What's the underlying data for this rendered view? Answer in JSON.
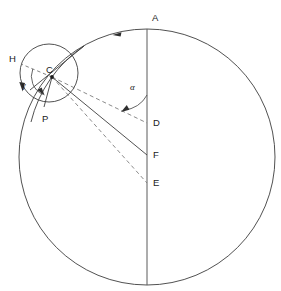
{
  "figure": {
    "kind": "geometric-diagram",
    "background_color": "#ffffff",
    "line_color": "#3d3d3d",
    "dashed_color": "#767676",
    "canvas": {
      "width": 281,
      "height": 291
    }
  },
  "labels": {
    "A": "A",
    "H": "H",
    "C": "C",
    "P": "P",
    "D": "D",
    "F": "F",
    "E": "E",
    "alpha": "α",
    "gamma": "γ"
  },
  "points": {
    "A": {
      "x": 152,
      "y": 18,
      "anchor_x": 147,
      "anchor_y": 29
    },
    "H": {
      "x": 12,
      "y": 59,
      "anchor_x": 21,
      "anchor_y": 64
    },
    "C": {
      "x": 49,
      "y": 70,
      "anchor_x": 52,
      "anchor_y": 77
    },
    "P": {
      "x": 45,
      "y": 118,
      "anchor_x": 44,
      "anchor_y": 105
    },
    "D": {
      "x": 153,
      "y": 123,
      "anchor_x": 147,
      "anchor_y": 123
    },
    "F": {
      "x": 153,
      "y": 155,
      "anchor_x": 147,
      "anchor_y": 155
    },
    "E": {
      "x": 153,
      "y": 183,
      "anchor_x": 147,
      "anchor_y": 183
    },
    "alpha": {
      "x": 133,
      "y": 88
    },
    "gamma": {
      "x": 24,
      "y": 85
    }
  },
  "circles": {
    "large": {
      "cx": 147,
      "cy": 157,
      "r": 128,
      "style": "solid"
    },
    "small": {
      "cx": 49,
      "cy": 73,
      "r": 29,
      "style": "solid"
    }
  },
  "axis": {
    "name": "vertical-axis",
    "x": 147,
    "y_top": 29,
    "y_bottom": 285,
    "style": "solid"
  },
  "rays": [
    {
      "name": "ray-C-to-D",
      "from": "C",
      "to": "D",
      "style": "dashed"
    },
    {
      "name": "ray-C-to-F",
      "from": "C",
      "to": "F",
      "style": "solid"
    },
    {
      "name": "ray-C-to-E",
      "from": "C",
      "to": "E",
      "style": "dashed"
    },
    {
      "name": "ray-C-to-H",
      "from": "C",
      "to": "H",
      "style": "dashed"
    },
    {
      "name": "ray-C-to-P",
      "from": "C",
      "to": "P",
      "style": "solid"
    }
  ],
  "angles": [
    {
      "name": "angle-alpha",
      "symbol": "α",
      "vertex": "D",
      "between": [
        "vertical-axis-up",
        "ray-D-to-C"
      ],
      "arc_radius": 28,
      "arrow": "counterclockwise"
    },
    {
      "name": "angle-gamma",
      "symbol": "γ",
      "vertex": "C",
      "between": [
        "ray-C-to-H",
        "ray-C-to-P"
      ],
      "arc_radius": 20,
      "arrow": "counterclockwise"
    }
  ],
  "arrows": [
    {
      "name": "orbit-direction-arrow-large",
      "on": "large-circle",
      "at_x": 117,
      "at_y": 34,
      "direction": "counterclockwise"
    },
    {
      "name": "rotation-direction-arrow-small",
      "on": "small-circle",
      "at_x": 21,
      "at_y": 87,
      "direction": "counterclockwise"
    }
  ]
}
